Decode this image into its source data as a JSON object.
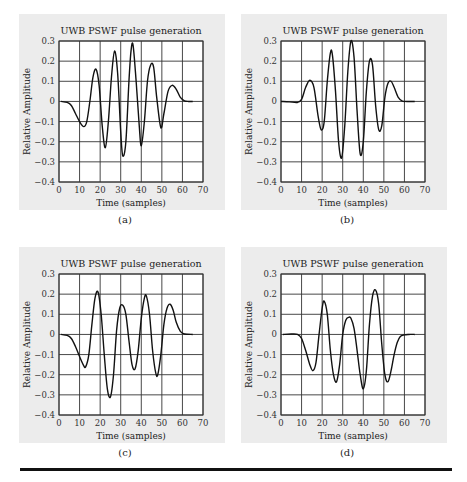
{
  "figure": {
    "rule_color": "#111111",
    "panel_bg": "#ececec",
    "line_color": "#111111"
  },
  "chart_data": [
    {
      "id": "a",
      "caption": "(a)",
      "type": "line",
      "title": "UWB PSWF pulse generation",
      "xlabel": "Time (samples)",
      "ylabel": "Relative Amplitude",
      "xlim": [
        0,
        70
      ],
      "ylim": [
        -0.4,
        0.3
      ],
      "xticks": [
        0,
        10,
        20,
        30,
        40,
        50,
        60,
        70
      ],
      "yticks": [
        0.3,
        0.2,
        0.1,
        0,
        -0.1,
        -0.2,
        -0.3,
        -0.4
      ],
      "ytick_labels": [
        "0.3",
        "0.2",
        "0.1",
        "0",
        "−0.1",
        "−0.2",
        "−0.3",
        "−0.4"
      ],
      "grid": true,
      "x": [
        1,
        4,
        6,
        8,
        10,
        12,
        13.5,
        15,
        16.5,
        18,
        19.5,
        21,
        22.5,
        24,
        25.5,
        27,
        28.5,
        30,
        31,
        32.5,
        34,
        35,
        36,
        37.5,
        39,
        40,
        41.5,
        43,
        44.5,
        46,
        47.5,
        49.5,
        51,
        53,
        55,
        57,
        59,
        61,
        63,
        65
      ],
      "y": [
        0,
        -0.005,
        -0.02,
        -0.06,
        -0.1,
        -0.125,
        -0.1,
        0,
        0.12,
        0.16,
        0.08,
        -0.12,
        -0.23,
        -0.1,
        0.12,
        0.25,
        0.14,
        -0.15,
        -0.27,
        -0.2,
        0.1,
        0.25,
        0.28,
        0.1,
        -0.12,
        -0.22,
        -0.1,
        0.1,
        0.18,
        0.17,
        0.02,
        -0.13,
        -0.06,
        0.05,
        0.08,
        0.06,
        0.02,
        0.003,
        0,
        0
      ]
    },
    {
      "id": "b",
      "caption": "(b)",
      "type": "line",
      "title": "UWB PSWF pulse generation",
      "xlabel": "Time (samples)",
      "ylabel": "Relative Amplitude",
      "xlim": [
        0,
        70
      ],
      "ylim": [
        -0.4,
        0.3
      ],
      "xticks": [
        0,
        10,
        20,
        30,
        40,
        50,
        60,
        70
      ],
      "yticks": [
        0.3,
        0.2,
        0.1,
        0,
        -0.1,
        -0.2,
        -0.3,
        -0.4
      ],
      "ytick_labels": [
        "0.3",
        "0.2",
        "0.1",
        "0",
        "−0.1",
        "−0.2",
        "−0.3",
        "−0.4"
      ],
      "grid": true,
      "x": [
        0,
        4,
        8,
        10,
        12,
        14,
        16,
        18,
        19.5,
        21,
        22.5,
        24,
        25,
        26.5,
        28,
        29.5,
        31,
        32.5,
        34,
        35.5,
        37,
        38.5,
        40,
        41.5,
        43,
        44.5,
        46,
        47.5,
        49,
        50.5,
        52,
        53.5,
        55,
        57,
        59,
        61,
        65
      ],
      "y": [
        0,
        -0.002,
        -0.005,
        0.01,
        0.07,
        0.105,
        0.07,
        -0.07,
        -0.14,
        -0.1,
        0.1,
        0.24,
        0.23,
        0.05,
        -0.2,
        -0.28,
        -0.12,
        0.15,
        0.3,
        0.22,
        -0.05,
        -0.26,
        -0.2,
        0.05,
        0.2,
        0.18,
        -0.02,
        -0.14,
        -0.12,
        0.02,
        0.09,
        0.1,
        0.07,
        0.02,
        0.002,
        0,
        0
      ]
    },
    {
      "id": "c",
      "caption": "(c)",
      "type": "line",
      "title": "UWB PSWF pulse generation",
      "xlabel": "Time (samples)",
      "ylabel": "Relative Amplitude",
      "xlim": [
        0,
        70
      ],
      "ylim": [
        -0.4,
        0.3
      ],
      "xticks": [
        0,
        10,
        20,
        30,
        40,
        50,
        60,
        70
      ],
      "yticks": [
        0.3,
        0.2,
        0.1,
        0,
        -0.1,
        -0.2,
        -0.3,
        -0.4
      ],
      "ytick_labels": [
        "0.3",
        "0.2",
        "0.1",
        "0",
        "−0.1",
        "−0.2",
        "−0.3",
        "−0.4"
      ],
      "grid": true,
      "x": [
        1,
        4,
        6,
        8,
        10,
        12,
        13,
        14.5,
        16,
        17.5,
        19,
        20.5,
        22,
        23.5,
        25,
        26.5,
        28,
        29.5,
        31,
        32.5,
        34,
        35.5,
        37,
        38.5,
        40,
        41.5,
        42.5,
        44,
        45.5,
        47,
        48,
        49.5,
        51,
        52.5,
        54,
        55.5,
        57,
        59,
        61,
        65
      ],
      "y": [
        0,
        -0.005,
        -0.02,
        -0.06,
        -0.11,
        -0.155,
        -0.16,
        -0.1,
        0.05,
        0.18,
        0.21,
        0.1,
        -0.1,
        -0.27,
        -0.31,
        -0.2,
        0.02,
        0.13,
        0.145,
        0.1,
        -0.03,
        -0.15,
        -0.17,
        -0.08,
        0.08,
        0.18,
        0.19,
        0.1,
        -0.08,
        -0.19,
        -0.2,
        -0.1,
        0.05,
        0.13,
        0.15,
        0.12,
        0.06,
        0.015,
        0.002,
        0
      ]
    },
    {
      "id": "d",
      "caption": "(d)",
      "type": "line",
      "title": "UWB PSWF pulse generation",
      "xlabel": "Time (samples)",
      "ylabel": "Relative Amplitude",
      "xlim": [
        0,
        70
      ],
      "ylim": [
        -0.4,
        0.3
      ],
      "xticks": [
        0,
        10,
        20,
        30,
        40,
        50,
        60,
        70
      ],
      "yticks": [
        0.3,
        0.2,
        0.1,
        0,
        -0.1,
        -0.2,
        -0.3,
        -0.4
      ],
      "ytick_labels": [
        "0.3",
        "0.2",
        "0.1",
        "0",
        "−0.1",
        "−0.2",
        "−0.3",
        "−0.4"
      ],
      "grid": true,
      "x": [
        1,
        5,
        8,
        10,
        12,
        14,
        15.5,
        17,
        18.5,
        20,
        21,
        22.5,
        24,
        25.5,
        27,
        28.5,
        30,
        31.5,
        33,
        34,
        35.5,
        37,
        38.5,
        40,
        41.5,
        43,
        44.5,
        46,
        47.5,
        49,
        50.5,
        52,
        53.5,
        55,
        56.5,
        58,
        60,
        62,
        65
      ],
      "y": [
        0,
        0.002,
        0.0,
        -0.02,
        -0.08,
        -0.15,
        -0.18,
        -0.14,
        0.0,
        0.13,
        0.165,
        0.1,
        -0.08,
        -0.2,
        -0.235,
        -0.15,
        0.0,
        0.07,
        0.085,
        0.08,
        0.03,
        -0.08,
        -0.2,
        -0.27,
        -0.18,
        0.05,
        0.19,
        0.22,
        0.15,
        -0.05,
        -0.2,
        -0.235,
        -0.18,
        -0.1,
        -0.04,
        -0.01,
        -0.002,
        0,
        0
      ]
    }
  ]
}
